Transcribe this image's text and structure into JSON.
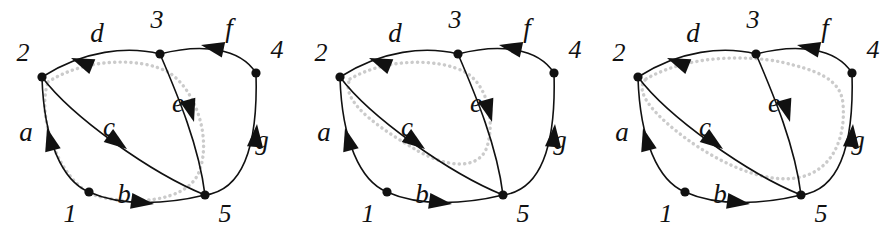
{
  "figure": {
    "type": "directed-graph-diagram",
    "panel_count": 3,
    "panel_width": 298,
    "panel_height": 243,
    "colors": {
      "stroke": "#111111",
      "node": "#111111",
      "cycle_highlight": "#cbcbcb",
      "background": "#ffffff"
    }
  },
  "graph": {
    "nodes": [
      {
        "id": "1",
        "label": "1",
        "x": 89,
        "y": 192,
        "label_x": 70,
        "label_y": 216
      },
      {
        "id": "2",
        "label": "2",
        "x": 42,
        "y": 77,
        "label_x": 23,
        "label_y": 55
      },
      {
        "id": "3",
        "label": "3",
        "x": 160,
        "y": 54,
        "label_x": 157,
        "label_y": 22
      },
      {
        "id": "4",
        "label": "4",
        "x": 256,
        "y": 73,
        "label_x": 277,
        "label_y": 52
      },
      {
        "id": "5",
        "label": "5",
        "x": 205,
        "y": 195,
        "label_x": 225,
        "label_y": 216
      }
    ],
    "edges": [
      {
        "id": "a",
        "label": "a",
        "from": "1",
        "to": "2",
        "label_x": 26,
        "label_y": 135
      },
      {
        "id": "b",
        "label": "b",
        "from": "1",
        "to": "5",
        "label_x": 124,
        "label_y": 197
      },
      {
        "id": "c",
        "label": "c",
        "from": "2",
        "to": "5",
        "label_x": 109,
        "label_y": 130
      },
      {
        "id": "d",
        "label": "d",
        "from": "3",
        "to": "2",
        "label_x": 97,
        "label_y": 36
      },
      {
        "id": "e",
        "label": "e",
        "from": "3",
        "to": "5",
        "label_x": 178,
        "label_y": 106
      },
      {
        "id": "f",
        "label": "f",
        "from": "4",
        "to": "3",
        "label_x": 229,
        "label_y": 31
      },
      {
        "id": "g",
        "label": "g",
        "from": "5",
        "to": "4",
        "label_x": 262,
        "label_y": 143
      }
    ]
  },
  "panels": [
    {
      "index": 1,
      "name": "cycle-d-c-highlight",
      "highlighted_cycle": [
        "2",
        "3",
        "5",
        "1",
        "2"
      ],
      "highlighted_edges": [
        "d",
        "e",
        "b",
        "a"
      ],
      "offset_x": 0
    },
    {
      "index": 2,
      "name": "cycle-d-e-c-highlight",
      "highlighted_cycle": [
        "2",
        "3",
        "5",
        "2"
      ],
      "highlighted_edges": [
        "d",
        "e",
        "c"
      ],
      "offset_x": 298
    },
    {
      "index": 3,
      "name": "cycle-d-f-g-c-highlight",
      "highlighted_cycle": [
        "2",
        "3",
        "4",
        "5",
        "2"
      ],
      "highlighted_edges": [
        "d",
        "f",
        "g",
        "c"
      ],
      "offset_x": 596
    }
  ]
}
